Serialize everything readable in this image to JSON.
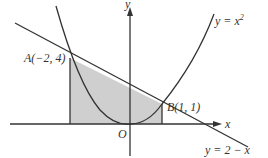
{
  "diagram": {
    "axes": {
      "x_label": "x",
      "y_label": "y",
      "origin_label": "O"
    },
    "curves": [
      {
        "label": "y = x",
        "sup": "2",
        "type": "parabola"
      },
      {
        "label": "y = 2 − x",
        "type": "line"
      }
    ],
    "points": [
      {
        "label": "A(−2, 4)",
        "x": -2,
        "y": 4
      },
      {
        "label": "B(1, 1)",
        "x": 1,
        "y": 1
      }
    ],
    "shaded_region": {
      "from_x": -2,
      "to_x": 1,
      "description": "region under y = 2 − x above x-axis"
    },
    "colors": {
      "shade": "#cfcfcf",
      "stroke": "#333333"
    }
  }
}
